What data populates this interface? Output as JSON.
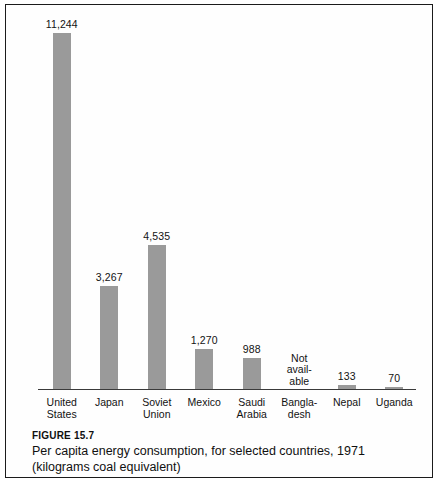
{
  "figure": {
    "number_label": "FIGURE 15.7",
    "caption": "Per capita energy consumption, for selected countries, 1971 (kilograms coal equivalent)"
  },
  "chart_data": {
    "type": "bar",
    "title": "Per capita energy consumption, for selected countries, 1971 (kilograms coal equivalent)",
    "xlabel": "",
    "ylabel": "",
    "ylim": [
      0,
      11244
    ],
    "grid": false,
    "legend": "none",
    "axis_visible": {
      "x_axis_line": true,
      "y_axis_line": false,
      "y_tick_labels": false
    },
    "value_labels_shown": true,
    "categories": [
      "United States",
      "Japan",
      "Soviet Union",
      "Mexico",
      "Saudi Arabia",
      "Bangladesh",
      "Nepal",
      "Uganda"
    ],
    "category_label_lines": [
      [
        "United",
        "States"
      ],
      [
        "Japan",
        ""
      ],
      [
        "Soviet",
        "Union"
      ],
      [
        "Mexico",
        ""
      ],
      [
        "Saudi",
        "Arabia"
      ],
      [
        "Bangla-",
        "desh"
      ],
      [
        "Nepal",
        ""
      ],
      [
        "Uganda",
        ""
      ]
    ],
    "values": [
      11244,
      3267,
      4535,
      1270,
      988,
      null,
      133,
      70
    ],
    "value_display_labels": [
      "11,244",
      "3,267",
      "4,535",
      "1,270",
      "988",
      "",
      "133",
      "70"
    ],
    "missing_data_note": [
      "Not",
      "avail-",
      "able"
    ],
    "missing_data_note_text": "Not available",
    "bar_color": "#9a9a9a",
    "axis_color": "#3a3a3a",
    "text_color": "#121212",
    "background_color": "#ffffff"
  }
}
